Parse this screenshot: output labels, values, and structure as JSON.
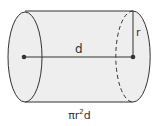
{
  "diagram": {
    "shape": "cylinder",
    "labels": {
      "length": "d",
      "radius": "r"
    },
    "formula": {
      "prefix": "πr",
      "exponent": "2",
      "suffix": "d"
    },
    "colors": {
      "fill": "#eeeeee",
      "stroke": "#333333"
    }
  }
}
